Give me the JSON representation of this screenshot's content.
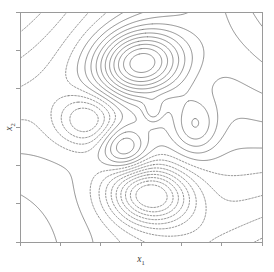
{
  "figure": {
    "title": "",
    "background_color": "#ffffff",
    "frame_color": "#9a9a9a",
    "contour_color": "#4a4a4a"
  },
  "axes": {
    "x_label_main": "x",
    "x_label_sub": "1",
    "y_label_main": "x",
    "y_label_sub": "2",
    "x_tick_count": 7,
    "y_tick_count": 7,
    "x_tick_labels": [
      "",
      "",
      "",
      "",
      "",
      "",
      ""
    ],
    "y_tick_labels": [
      "",
      "",
      "",
      "",
      "",
      "",
      ""
    ],
    "frame": {
      "left": 20,
      "top": 12,
      "right": 262,
      "bottom": 242
    }
  },
  "chart_data": {
    "type": "contour",
    "title": "",
    "xlabel": "x_1",
    "ylabel": "x_2",
    "xlim": [
      -3,
      3
    ],
    "ylim": [
      -3,
      3
    ],
    "grid": false,
    "legend": "none",
    "linestyles": {
      "positive": "solid",
      "negative": "dashed",
      "zero": "solid"
    },
    "level_step": 0.2,
    "levels": [
      -1.8,
      -1.6,
      -1.4,
      -1.2,
      -1.0,
      -0.8,
      -0.6,
      -0.4,
      -0.2,
      0.0,
      0.2,
      0.4,
      0.6,
      0.8,
      1.0,
      1.2,
      1.4,
      1.6,
      1.8,
      2.0
    ],
    "features": [
      {
        "name": "upper-central-maximum",
        "kind": "peak",
        "sign": "positive",
        "linestyle": "solid",
        "ring_count": 10,
        "center_px": [
          140,
          63
        ],
        "center_xy": [
          0.98,
          1.66
        ]
      },
      {
        "name": "lower-central-minimum",
        "kind": "trough",
        "sign": "negative",
        "linestyle": "dashed",
        "ring_count": 9,
        "center_px": [
          150,
          195
        ],
        "center_xy": [
          1.23,
          -1.78
        ]
      },
      {
        "name": "left-minimum",
        "kind": "trough",
        "sign": "negative",
        "linestyle": "dashed",
        "ring_count": 4,
        "center_px": [
          88,
          120
        ],
        "center_xy": [
          -0.31,
          0.18
        ]
      },
      {
        "name": "mid-left-maximum",
        "kind": "peak",
        "sign": "positive",
        "linestyle": "solid",
        "ring_count": 4,
        "center_px": [
          124,
          148
        ],
        "center_xy": [
          0.58,
          -0.55
        ]
      },
      {
        "name": "right-maximum",
        "kind": "peak",
        "sign": "positive",
        "linestyle": "solid",
        "ring_count": 3,
        "center_px": [
          195,
          126
        ],
        "center_xy": [
          2.34,
          0.03
        ]
      },
      {
        "name": "small-central-blob",
        "kind": "peak",
        "sign": "positive",
        "linestyle": "solid",
        "ring_count": 1,
        "center_px": [
          153,
          112
        ],
        "center_xy": [
          1.31,
          0.39
        ]
      },
      {
        "name": "upper-left-zero-contour",
        "kind": "open-curve",
        "sign": "zero",
        "linestyle": "solid",
        "entry_px": [
          20,
          48
        ],
        "exit_px": [
          118,
          12
        ]
      },
      {
        "name": "lower-left-zero-contour",
        "kind": "open-curve",
        "sign": "zero",
        "linestyle": "solid",
        "entry_px": [
          20,
          188
        ],
        "exit_px": [
          262,
          222
        ]
      }
    ]
  }
}
